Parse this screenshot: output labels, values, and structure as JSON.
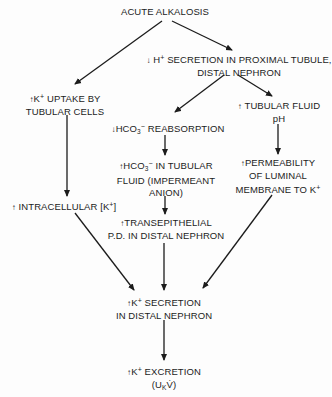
{
  "diagram": {
    "nodes": {
      "acute_alkalosis": {
        "lines": [
          "ACUTE ALKALOSIS"
        ]
      },
      "h_secretion": {
        "prefix": "↓",
        "lines": [
          "H",
          "SECRETION IN PROXIMAL TUBULE,",
          "DISTAL NEPHRON"
        ],
        "sup": "+"
      },
      "k_uptake": {
        "prefix": "↑",
        "line1_a": "K",
        "sup": "+",
        "line1_b": " UPTAKE BY",
        "line2": "TUBULAR CELLS"
      },
      "tubular_fluid_ph": {
        "prefix": "↑",
        "line1": " TUBULAR FLUID",
        "line2": "pH"
      },
      "hco3_reabsorption": {
        "prefix": "↓",
        "a": "HCO",
        "sub": "3",
        "sup": "−",
        "b": " REABSORPTION"
      },
      "hco3_tubular_fluid": {
        "prefix": "↑",
        "a": "HCO",
        "sub": "3",
        "sup": "−",
        "b": " IN TUBULAR",
        "line2": "FLUID (IMPERMEANT",
        "line3": "ANION)"
      },
      "permeability": {
        "prefix": "↑",
        "line1": "PERMEABILITY",
        "line2": "OF LUMINAL",
        "line3_a": "MEMBRANE TO K",
        "sup": "+"
      },
      "intracellular_k": {
        "prefix": "↑",
        "a": " INTRACELLULAR [K",
        "sup": "+",
        "b": "]"
      },
      "transepithelial_pd": {
        "prefix": "↑",
        "line1": "TRANSEPITHELIAL",
        "line2": "P.D. IN DISTAL NEPHRON"
      },
      "k_secretion": {
        "prefix": "↑",
        "a": "K",
        "sup": "+",
        "b": " SECRETION",
        "line2": "IN DISTAL NEPHRON"
      },
      "k_excretion": {
        "prefix": "↑",
        "a": "K",
        "sup": "+",
        "b": " EXCRETION",
        "line2_a": "(U",
        "line2_sub": "K",
        "line2_b": "V̇)"
      }
    },
    "edges": [
      {
        "from": "acute_alkalosis",
        "to": "k_uptake"
      },
      {
        "from": "acute_alkalosis",
        "to": "h_secretion"
      },
      {
        "from": "h_secretion",
        "to": "hco3_reabsorption"
      },
      {
        "from": "h_secretion",
        "to": "tubular_fluid_ph"
      },
      {
        "from": "k_uptake",
        "to": "intracellular_k"
      },
      {
        "from": "hco3_reabsorption",
        "to": "hco3_tubular_fluid"
      },
      {
        "from": "tubular_fluid_ph",
        "to": "permeability"
      },
      {
        "from": "hco3_tubular_fluid",
        "to": "transepithelial_pd"
      },
      {
        "from": "intracellular_k",
        "to": "k_secretion"
      },
      {
        "from": "transepithelial_pd",
        "to": "k_secretion"
      },
      {
        "from": "permeability",
        "to": "k_secretion"
      },
      {
        "from": "k_secretion",
        "to": "k_excretion"
      }
    ],
    "colors": {
      "ink": "#1c1c1c",
      "background": "#fdfdfd"
    }
  }
}
